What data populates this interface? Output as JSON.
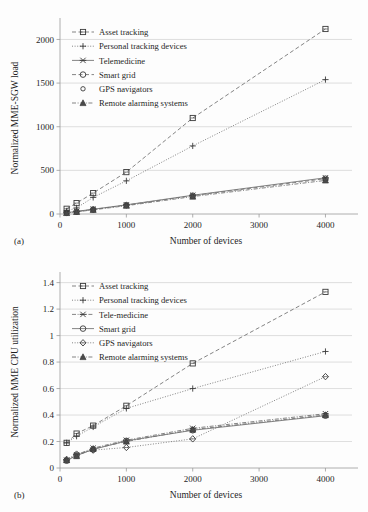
{
  "figure": {
    "panel_a_label": "(a)",
    "panel_b_label": "(b)"
  },
  "chart_data": [
    {
      "id": "a",
      "type": "line",
      "title": "",
      "xlabel": "Number of devices",
      "ylabel": "Normalized MME-SGW load",
      "x": [
        100,
        250,
        500,
        1000,
        2000,
        4000
      ],
      "xticks": [
        0,
        1000,
        2000,
        3000,
        4000
      ],
      "xticklabels": [
        "0",
        "1000",
        "2000",
        "3000",
        "4000"
      ],
      "yticks": [
        0,
        500,
        1000,
        1500,
        2000
      ],
      "yticklabels": [
        "0",
        "500",
        "1000",
        "1500",
        "2000"
      ],
      "xlim": [
        0,
        4400
      ],
      "ylim": [
        0,
        2200
      ],
      "grid": true,
      "legend_position": "upper left",
      "series": [
        {
          "name": "Asset tracking",
          "marker": "square-open",
          "dash": "dashed",
          "values": [
            60,
            125,
            240,
            480,
            1100,
            2120
          ]
        },
        {
          "name": "Personal tracking devices",
          "marker": "plus",
          "dash": "dotted",
          "values": [
            35,
            70,
            190,
            380,
            780,
            1540
          ]
        },
        {
          "name": "Telemedicine",
          "marker": "x-cross",
          "dash": "solid",
          "values": [
            15,
            30,
            55,
            105,
            215,
            415
          ]
        },
        {
          "name": "Smart grid",
          "marker": "circle-open",
          "dash": "dashed",
          "values": [
            14,
            28,
            52,
            102,
            210,
            405
          ]
        },
        {
          "name": "GPS navigators",
          "marker": "circle-small",
          "dash": "none",
          "values": [
            13,
            26,
            50,
            98,
            205,
            395
          ]
        },
        {
          "name": "Remote alarming systems",
          "marker": "triangle-filled",
          "dash": "dashdot",
          "values": [
            12,
            24,
            48,
            95,
            200,
            385
          ]
        }
      ]
    },
    {
      "id": "b",
      "type": "line",
      "title": "",
      "xlabel": "Number of devices",
      "ylabel": "Normalized MME CPU utilization",
      "x": [
        100,
        250,
        500,
        1000,
        2000,
        4000
      ],
      "xticks": [
        0,
        1000,
        2000,
        3000,
        4000
      ],
      "xticklabels": [
        "0",
        "1000",
        "2000",
        "3000",
        "4000"
      ],
      "yticks": [
        0,
        0.2,
        0.4,
        0.6,
        0.8,
        1,
        1.2,
        1.4
      ],
      "yticklabels": [
        "0",
        "0.2",
        "0.4",
        "0.6",
        "0.8",
        "1",
        "1.2",
        "1.4"
      ],
      "xlim": [
        0,
        4400
      ],
      "ylim": [
        0,
        1.45
      ],
      "grid": true,
      "legend_position": "upper left",
      "series": [
        {
          "name": "Asset tracking",
          "marker": "square-open",
          "dash": "dashed",
          "values": [
            0.19,
            0.26,
            0.32,
            0.47,
            0.79,
            1.33
          ]
        },
        {
          "name": "Personal tracking devices",
          "marker": "plus",
          "dash": "dotted",
          "values": [
            0.19,
            0.24,
            0.31,
            0.45,
            0.6,
            0.88
          ]
        },
        {
          "name": "Tele-medicine",
          "marker": "x-cross",
          "dash": "dashdot",
          "values": [
            0.06,
            0.1,
            0.15,
            0.21,
            0.3,
            0.41
          ]
        },
        {
          "name": "Smart grid",
          "marker": "circle-open",
          "dash": "solid",
          "values": [
            0.055,
            0.095,
            0.14,
            0.205,
            0.285,
            0.395
          ]
        },
        {
          "name": "GPS navigators",
          "marker": "diamond-open",
          "dash": "dotted",
          "values": [
            0.065,
            0.105,
            0.135,
            0.155,
            0.22,
            0.69
          ]
        },
        {
          "name": "Remote alarming systems",
          "marker": "triangle-filled",
          "dash": "dashdot",
          "values": [
            0.06,
            0.09,
            0.145,
            0.2,
            0.29,
            0.4
          ]
        }
      ]
    }
  ]
}
